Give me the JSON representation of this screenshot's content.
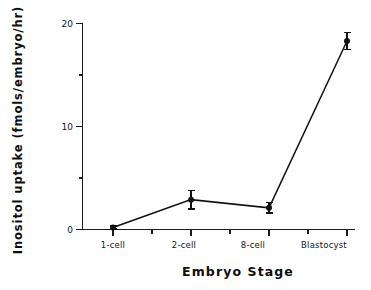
{
  "chart_data": {
    "type": "line",
    "title": "",
    "xlabel": "Embryo  Stage",
    "ylabel": "Inositol  uptake  (fmols/embryo/hr)",
    "categories": [
      "1-cell",
      "2-cell",
      "8-cell",
      "Blastocyst"
    ],
    "values": [
      0.2,
      2.9,
      2.1,
      18.3
    ],
    "errors": [
      0.15,
      0.9,
      0.5,
      0.8
    ],
    "ylim": [
      0,
      20
    ],
    "y_major_ticks": [
      0,
      10,
      20
    ],
    "y_major_tick_labels": [
      "0",
      "10",
      "20"
    ],
    "y_minor_ticks": [
      5,
      15
    ],
    "grid": false,
    "legend": "none",
    "marker": "filled-circle",
    "series": [
      {
        "name": "Inositol uptake",
        "values": [
          0.2,
          2.9,
          2.1,
          18.3
        ],
        "errors": [
          0.15,
          0.9,
          0.5,
          0.8
        ]
      }
    ]
  },
  "axes": {
    "x_title": "Embryo  Stage",
    "y_title": "Inositol  uptake  (fmols/embryo/hr)",
    "y_tick_labels": [
      "20",
      "10",
      "0"
    ],
    "x_tick_labels": [
      "1-cell",
      "2-cell",
      "8-cell",
      "Blastocyst"
    ]
  },
  "colors": {
    "line": "#111111",
    "marker": "#111111",
    "axis": "#1a1a1a",
    "text": "#0d0d0d",
    "background": "#ffffff"
  }
}
